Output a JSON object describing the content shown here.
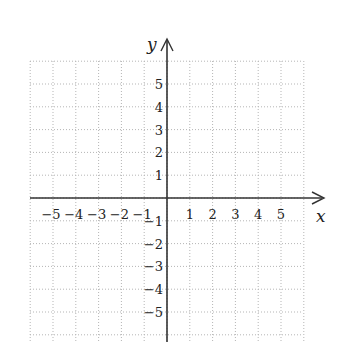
{
  "diagram": {
    "type": "coordinate-grid",
    "x_axis": {
      "label": "x",
      "ticks": [
        "-5",
        "-4",
        "-3",
        "-2",
        "-1",
        "1",
        "2",
        "3",
        "4",
        "5"
      ]
    },
    "y_axis": {
      "label": "y",
      "ticks": [
        "5",
        "4",
        "3",
        "2",
        "1",
        "-1",
        "-2",
        "-3",
        "-4",
        "-5"
      ]
    },
    "range": {
      "x": [
        -6,
        6
      ],
      "y": [
        -6,
        6
      ]
    },
    "grid": "dotted",
    "colors": {
      "axis": "#333333",
      "grid": "#b0b0b0",
      "text": "#222222"
    }
  }
}
